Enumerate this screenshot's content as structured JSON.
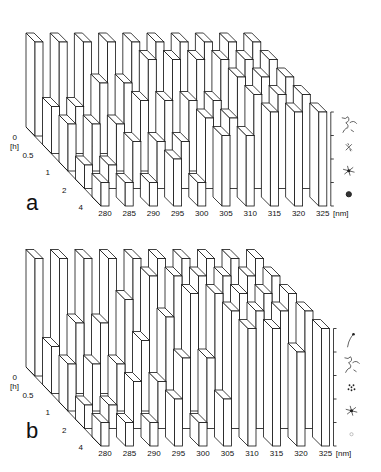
{
  "chart_data": [
    {
      "panel": "a",
      "type": "bar3d",
      "x_label": "[nm]",
      "x_categories": [
        "280",
        "285",
        "290",
        "295",
        "300",
        "305",
        "310",
        "315",
        "320",
        "325"
      ],
      "y_label": "[h]",
      "y_categories": [
        "0",
        "0.5",
        "1",
        "2",
        "4"
      ],
      "z_levels": 4,
      "z_level_icons": [
        "compact-globule-icon",
        "condensed-star-icon",
        "partially-condensed-icon",
        "extended-coil-icon"
      ],
      "values": {
        "280": [
          4,
          2,
          2,
          1,
          1
        ],
        "285": [
          4,
          2,
          2,
          1,
          1
        ],
        "290": [
          4,
          3,
          2,
          2,
          1
        ],
        "295": [
          4,
          3,
          3,
          2,
          2
        ],
        "300": [
          4,
          4,
          3,
          2,
          1
        ],
        "305": [
          4,
          4,
          3,
          3,
          3
        ],
        "310": [
          4,
          4,
          3,
          3,
          3
        ],
        "315": [
          4,
          4,
          4,
          4,
          4
        ],
        "320": [
          4,
          4,
          4,
          4,
          4
        ],
        "325": [
          4,
          4,
          4,
          4,
          4
        ]
      }
    },
    {
      "panel": "b",
      "type": "bar3d",
      "x_label": "[nm]",
      "x_categories": [
        "280",
        "285",
        "290",
        "295",
        "300",
        "305",
        "310",
        "315",
        "320",
        "325"
      ],
      "y_label": "[h]",
      "y_categories": [
        "0",
        "0.5",
        "1",
        "2",
        "4"
      ],
      "z_levels": 5,
      "z_level_icons": [
        "faint-dot-icon",
        "condensed-star-icon",
        "clustered-dots-icon",
        "extended-coil-icon",
        "single-strand-icon"
      ],
      "values": {
        "280": [
          5,
          2,
          2,
          1,
          1
        ],
        "285": [
          5,
          3,
          2,
          1,
          1
        ],
        "290": [
          5,
          3,
          2,
          2,
          1
        ],
        "295": [
          5,
          4,
          3,
          2,
          2
        ],
        "300": [
          5,
          5,
          4,
          3,
          1
        ],
        "305": [
          5,
          5,
          5,
          3,
          2
        ],
        "310": [
          5,
          5,
          5,
          5,
          5
        ],
        "315": [
          5,
          5,
          5,
          5,
          5
        ],
        "320": [
          5,
          5,
          5,
          5,
          4
        ],
        "325": [
          5,
          5,
          5,
          5,
          5
        ]
      }
    }
  ],
  "panels": {
    "a": {
      "label": "a"
    },
    "b": {
      "label": "b"
    }
  }
}
